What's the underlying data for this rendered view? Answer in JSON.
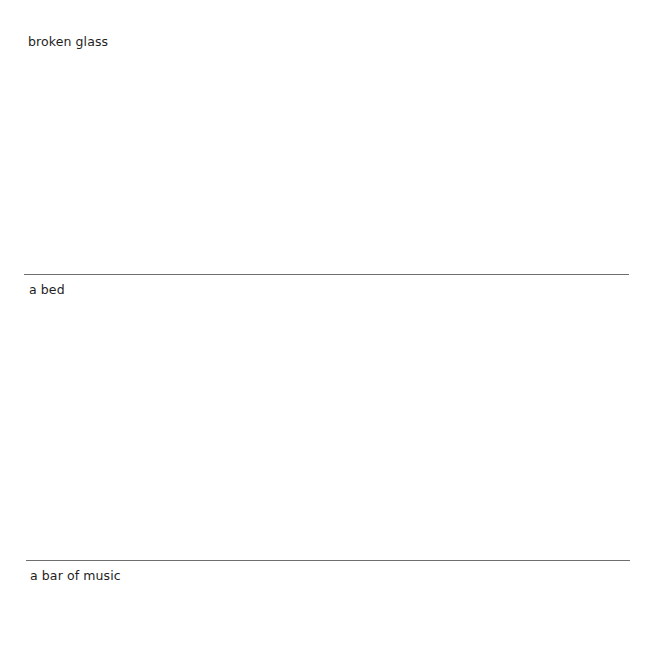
{
  "sections": [
    {
      "label": "broken glass"
    },
    {
      "label": "a bed"
    },
    {
      "label": "a bar of music"
    }
  ]
}
